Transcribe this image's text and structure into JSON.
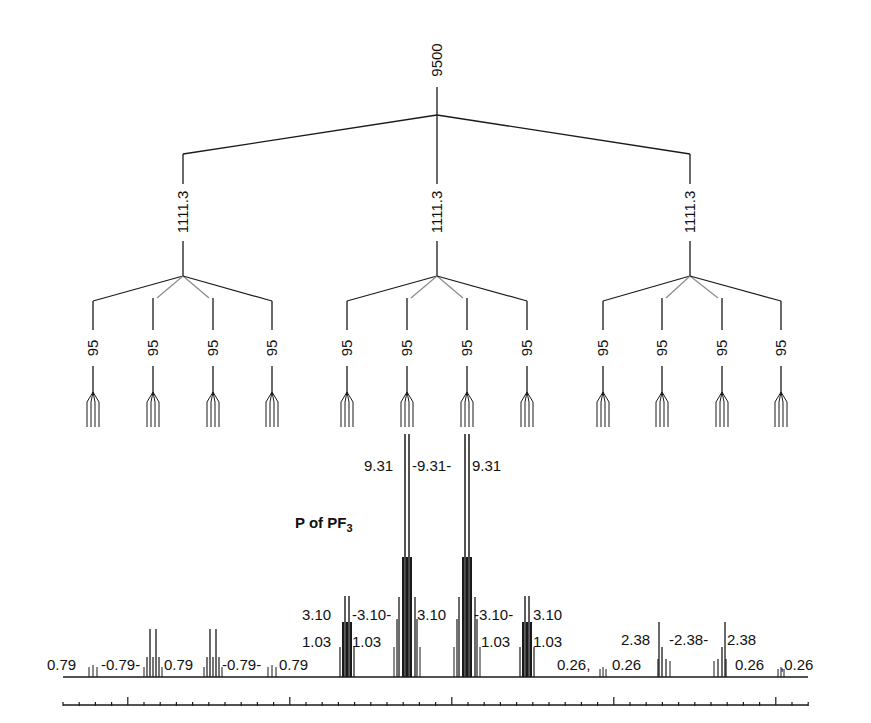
{
  "diagram": {
    "title": "P of PF",
    "title_subscript": "3",
    "colors": {
      "line": "#1a1a1a",
      "background": "#ffffff",
      "faint_line": "#8a8a8a"
    },
    "tree": {
      "level1": {
        "label": "9500",
        "x": 437
      },
      "level2": [
        {
          "label": "1111.3",
          "x": 183
        },
        {
          "label": "1111.3",
          "x": 437
        },
        {
          "label": "1111.3",
          "x": 690
        }
      ],
      "level3": [
        {
          "label": "95",
          "x": 93
        },
        {
          "label": "95",
          "x": 153
        },
        {
          "label": "95",
          "x": 213
        },
        {
          "label": "95",
          "x": 272
        },
        {
          "label": "95",
          "x": 347
        },
        {
          "label": "95",
          "x": 407
        },
        {
          "label": "95",
          "x": 467
        },
        {
          "label": "95",
          "x": 527
        },
        {
          "label": "95",
          "x": 603
        },
        {
          "label": "95",
          "x": 662
        },
        {
          "label": "95",
          "x": 722
        },
        {
          "label": "95",
          "x": 781
        }
      ]
    },
    "spectrum_labels": [
      {
        "text": "9.31",
        "x": 364,
        "y": 458
      },
      {
        "text": "-9.31-",
        "x": 412,
        "y": 458
      },
      {
        "text": "9.31",
        "x": 472,
        "y": 458
      },
      {
        "text": "3.10",
        "x": 302,
        "y": 607
      },
      {
        "text": "-3.10-",
        "x": 352,
        "y": 607
      },
      {
        "text": "3.10",
        "x": 417,
        "y": 607
      },
      {
        "text": "-3.10-",
        "x": 474,
        "y": 607
      },
      {
        "text": "3.10",
        "x": 533,
        "y": 607
      },
      {
        "text": "1.03",
        "x": 302,
        "y": 634
      },
      {
        "text": "1.03",
        "x": 352,
        "y": 634
      },
      {
        "text": "1.03",
        "x": 481,
        "y": 634
      },
      {
        "text": "1.03",
        "x": 533,
        "y": 634
      },
      {
        "text": "0.79",
        "x": 47,
        "y": 657
      },
      {
        "text": "-0.79-",
        "x": 101,
        "y": 657
      },
      {
        "text": "0.79",
        "x": 164,
        "y": 657
      },
      {
        "text": "-0.79-",
        "x": 222,
        "y": 657
      },
      {
        "text": "0.79",
        "x": 279,
        "y": 657
      },
      {
        "text": "2.38",
        "x": 621,
        "y": 632
      },
      {
        "text": "-2.38-",
        "x": 669,
        "y": 632
      },
      {
        "text": "2.38",
        "x": 727,
        "y": 632
      },
      {
        "text": "0.26,",
        "x": 557,
        "y": 657
      },
      {
        "text": "0.26",
        "x": 612,
        "y": 657
      },
      {
        "text": "0.26",
        "x": 735,
        "y": 657
      },
      {
        "text": ",0.26",
        "x": 780,
        "y": 657
      }
    ],
    "baseline": {
      "x1": 63,
      "x2": 808,
      "y": 677
    },
    "ruler": {
      "x1": 63,
      "x2": 808,
      "y": 705,
      "minor_step": 16.2,
      "major_every": 10,
      "first_major_offset": 4
    }
  }
}
